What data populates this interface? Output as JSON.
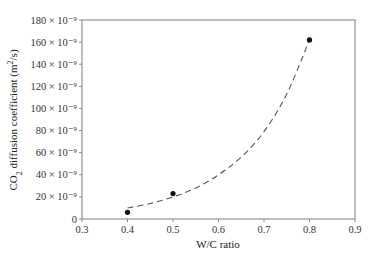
{
  "chart_data": {
    "type": "scatter",
    "title": "",
    "xlabel": "W/C ratio",
    "ylabel": "CO2 diffusion coefficient (m2/s)",
    "ylabel_parts": {
      "pre": "CO",
      "sub": "2",
      "mid": " diffusion coefficient (m",
      "sup": "2",
      "post": "/s)"
    },
    "xlim": [
      0.3,
      0.9
    ],
    "ylim": [
      0,
      1.8e-07
    ],
    "grid": false,
    "legend": null,
    "x_ticks": [
      0.3,
      0.4,
      0.5,
      0.6,
      0.7,
      0.8,
      0.9
    ],
    "x_tick_labels": [
      "0.3",
      "0.4",
      "0.5",
      "0.6",
      "0.7",
      "0.8",
      "0.9"
    ],
    "y_ticks": [
      0,
      20,
      40,
      60,
      80,
      100,
      120,
      140,
      160,
      180
    ],
    "y_tick_labels": [
      "0",
      "20 × 10⁻⁹",
      "40 × 10⁻⁹",
      "60 × 10⁻⁹",
      "80 × 10⁻⁹",
      "100 × 10⁻⁹",
      "120 × 10⁻⁹",
      "140 × 10⁻⁹",
      "160 × 10⁻⁹",
      "180 × 10⁻⁹"
    ],
    "y_unit_scale": 1e-09,
    "series": [
      {
        "name": "Measured",
        "type": "scatter",
        "marker": "filled-circle",
        "x": [
          0.4,
          0.5,
          0.8
        ],
        "y": [
          6e-09,
          2.3e-08,
          1.62e-07
        ]
      },
      {
        "name": "Exponential fit",
        "type": "line",
        "style": "dashed",
        "x": [
          0.4,
          0.45,
          0.5,
          0.55,
          0.6,
          0.65,
          0.7,
          0.75,
          0.8
        ],
        "y": [
          1e-08,
          1.4e-08,
          2e-08,
          2.8e-08,
          4e-08,
          5.6e-08,
          7.9e-08,
          1.13e-07,
          1.62e-07
        ]
      }
    ]
  }
}
